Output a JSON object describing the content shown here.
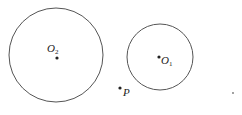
{
  "diagram": {
    "circles": [
      {
        "id": "O2",
        "cx": 56,
        "cy": 55,
        "r": 47
      },
      {
        "id": "O1",
        "cx": 160,
        "cy": 57,
        "r": 33
      }
    ],
    "points": [
      {
        "id": "O2",
        "label": "O",
        "subscript": "2",
        "x": 57,
        "y": 58
      },
      {
        "id": "O1",
        "label": "O",
        "subscript": "1",
        "x": 159,
        "y": 57
      },
      {
        "id": "P",
        "label": "P",
        "subscript": "",
        "x": 120,
        "y": 88
      }
    ],
    "stroke_color": "#555555"
  }
}
